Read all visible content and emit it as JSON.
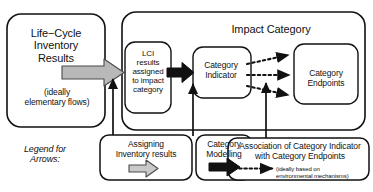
{
  "diagram": {
    "boxes": {
      "lci_results": {
        "title": "Life−Cycle\nInventory\nResults",
        "subtitle": "(ideally\nelementary flows)"
      },
      "impact_category": {
        "title": "Impact Category"
      },
      "lci_assigned": {
        "label": "LCI\nresults\nassigned\nto impact\ncategory"
      },
      "category_indicator": {
        "label": "Category\nIndicator"
      },
      "category_endpoints": {
        "label": "Category\nEndpoints"
      }
    },
    "legend": {
      "heading": "Legend for\nArrows:",
      "items": [
        {
          "label": "Assigning\nInventory results",
          "arrow": "hollow-gray-arrow-icon",
          "arrow_style": "outlined gray block arrow"
        },
        {
          "label": "Category\nModelling",
          "arrow": "solid-black-arrow-icon",
          "arrow_style": "solid black block arrow"
        },
        {
          "label": "Association of Category Indicator\nwith Category Endpoints",
          "sublabel": "(ideally based on\nenvironmental mechanisms)",
          "arrow": "dotted-black-arrow-icon",
          "arrow_style": "dotted line with solid arrowhead"
        }
      ]
    },
    "colors": {
      "stroke": "#111111",
      "fill": "#ffffff",
      "gray_arrow_fill": "#b8b8b8",
      "gray_arrow_stroke": "#555555",
      "black_arrow": "#111111",
      "text": "#111111"
    }
  }
}
